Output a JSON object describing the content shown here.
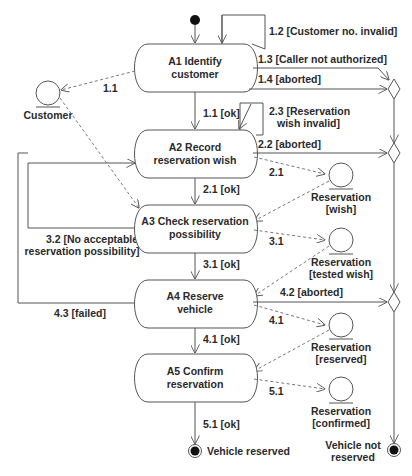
{
  "diagram": {
    "type": "activity-diagram",
    "colors": {
      "line": "#555555",
      "text": "#2a2a2a",
      "node_fill": "#ffffff",
      "terminal": "#111111"
    },
    "start_node": {
      "label": ""
    },
    "activities": [
      {
        "id": "A1",
        "line1": "A1 Identify",
        "line2": "customer"
      },
      {
        "id": "A2",
        "line1": "A2 Record",
        "line2": "reservation wish"
      },
      {
        "id": "A3",
        "line1": "A3 Check reservation",
        "line2": "possibility"
      },
      {
        "id": "A4",
        "line1": "A4 Reserve",
        "line2": "vehicle"
      },
      {
        "id": "A5",
        "line1": "A5 Confirm",
        "line2": "reservation"
      }
    ],
    "entities": [
      {
        "id": "customer",
        "line1": "Customer",
        "line2": ""
      },
      {
        "id": "res-wish",
        "line1": "Reservation",
        "line2": "[wish]"
      },
      {
        "id": "res-tested",
        "line1": "Reservation",
        "line2": "[tested wish]"
      },
      {
        "id": "res-reserved",
        "line1": "Reservation",
        "line2": "[reserved]"
      },
      {
        "id": "res-confirmed",
        "line1": "Reservation",
        "line2": "[confirmed]"
      }
    ],
    "transitions": {
      "t1_1": "1.1 [ok]",
      "t1_2": "1.2 [Customer no. invalid]",
      "t1_3": "1.3 [Caller not authorized]",
      "t1_4": "1.4 [aborted]",
      "t2_1": "2.1 [ok]",
      "t2_2": "2.2 [aborted]",
      "t2_3a": "2.3 [Reservation",
      "t2_3b": "wish invalid]",
      "t3_1": "3.1 [ok]",
      "t3_2a": "3.2 [No acceptable",
      "t3_2b": "reservation possibility]",
      "t4_1": "4.1 [ok]",
      "t4_2": "4.2 [aborted]",
      "t4_3": "4.3 [failed]",
      "t5_1": "5.1 [ok]"
    },
    "data_flows": {
      "f1_1": "1.1",
      "f2_1": "2.1",
      "f3_1": "3.1",
      "f4_1": "4.1",
      "f5_1": "5.1"
    },
    "end_nodes": {
      "success": "Vehicle reserved",
      "failure_line1": "Vehicle not",
      "failure_line2": "reserved"
    }
  }
}
